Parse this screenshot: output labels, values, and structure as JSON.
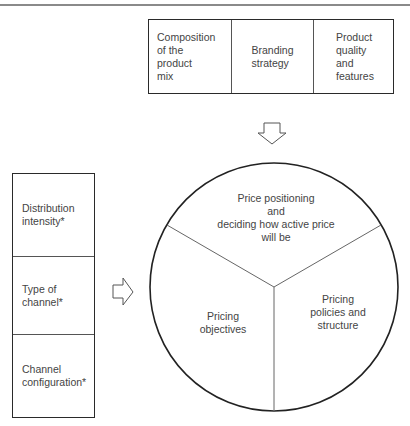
{
  "diagram": {
    "top_box": {
      "cells": [
        {
          "label": "Composition\nof the\nproduct\nmix"
        },
        {
          "label": "Branding\nstrategy"
        },
        {
          "label": "Product\nquality\nand\nfeatures"
        }
      ]
    },
    "left_box": {
      "cells": [
        {
          "label": "Distribution\nintensity*"
        },
        {
          "label": "Type of\nchannel*"
        },
        {
          "label": "Channel\nconfiguration*"
        }
      ]
    },
    "arrows": [
      {
        "direction": "down",
        "from": "top_box",
        "to": "pricing_circle"
      },
      {
        "direction": "right",
        "from": "left_box",
        "to": "pricing_circle"
      }
    ],
    "pricing_circle": {
      "segments": [
        {
          "label": "Price positioning\nand\ndeciding how active price\nwill be"
        },
        {
          "label": "Pricing\nobjectives"
        },
        {
          "label": "Pricing\npolicies and\nstructure"
        }
      ]
    }
  }
}
